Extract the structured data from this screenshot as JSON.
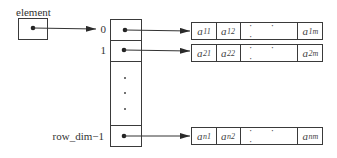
{
  "pointer": {
    "label": "element"
  },
  "column": {
    "indices": [
      "0",
      "1",
      "row_dim−1"
    ]
  },
  "rows": [
    {
      "index": "0",
      "cells": [
        {
          "base": "a",
          "sub": "11"
        },
        {
          "base": "a",
          "sub": "12"
        },
        {
          "dots": "· · ·"
        },
        {
          "base": "a",
          "sub": "1m"
        }
      ]
    },
    {
      "index": "1",
      "cells": [
        {
          "base": "a",
          "sub": "21"
        },
        {
          "base": "a",
          "sub": "22"
        },
        {
          "dots": "· · ·"
        },
        {
          "base": "a",
          "sub": "2m"
        }
      ]
    },
    {
      "index": "row_dim−1",
      "cells": [
        {
          "base": "a",
          "sub": "n1"
        },
        {
          "base": "a",
          "sub": "n2"
        },
        {
          "dots": "· · ·"
        },
        {
          "base": "a",
          "sub": "nm"
        }
      ]
    }
  ],
  "colors": {
    "stroke": "#3a3a3a",
    "text": "#333333",
    "background": "#ffffff"
  }
}
